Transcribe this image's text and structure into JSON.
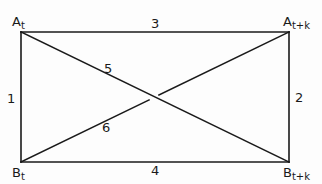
{
  "diagram": {
    "type": "rectangle-with-diagonals",
    "line_color": "#1a1a1a",
    "background": "#fdfdfd",
    "corners": {
      "top_left": {
        "base": "A",
        "sub": "t"
      },
      "top_right": {
        "base": "A",
        "sub": "t+k"
      },
      "bottom_left": {
        "base": "B",
        "sub": "t"
      },
      "bottom_right": {
        "base": "B",
        "sub": "t+k"
      }
    },
    "edges": {
      "left": "1",
      "right": "2",
      "top": "3",
      "bottom": "4",
      "diagonal_At_to_Btk": "5",
      "diagonal_Bt_to_Atk": "6"
    }
  }
}
